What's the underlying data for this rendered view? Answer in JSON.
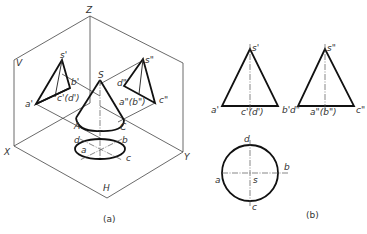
{
  "figure_a": {
    "caption": "(a)",
    "axes": {
      "z": "Z",
      "x": "X",
      "y": "Y"
    },
    "planes": {
      "v": "V",
      "h": "H"
    },
    "points_3d": {
      "apex": "S",
      "base_left": "A",
      "base_right": "C"
    },
    "front_projection": {
      "apex": "s'",
      "a": "a'",
      "b": "b'",
      "cd": "c'(d')"
    },
    "side_projection": {
      "apex": "s\"",
      "d": "d\"",
      "ab": "a\"(b\")",
      "c": "c\""
    },
    "top_projection": {
      "a": "a",
      "b": "b",
      "c": "c",
      "d": "d"
    }
  },
  "figure_b": {
    "caption": "(b)",
    "front_view": {
      "apex": "s'",
      "a": "a'",
      "cd": "c'(d')",
      "b": "b'"
    },
    "side_view": {
      "apex": "s\"",
      "d": "d\"",
      "ab": "a\"(b\")",
      "c": "c\""
    },
    "top_view": {
      "a": "a",
      "b": "b",
      "c": "c",
      "d": "d",
      "s": "s"
    }
  }
}
